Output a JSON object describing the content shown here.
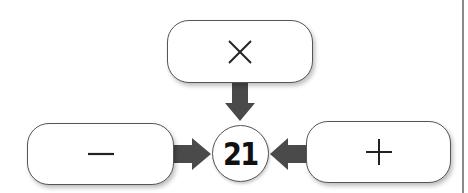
{
  "diagram": {
    "center_value": "21",
    "operators": [
      {
        "position": "top",
        "symbol": "×",
        "icon": "multiply-icon"
      },
      {
        "position": "left",
        "symbol": "−",
        "icon": "minus-icon"
      },
      {
        "position": "right",
        "symbol": "+",
        "icon": "plus-icon"
      }
    ],
    "colors": {
      "arrow": "#4a4a4a",
      "border": "#555555",
      "background": "#ffffff",
      "frame_line": "#8a8a8a"
    }
  }
}
